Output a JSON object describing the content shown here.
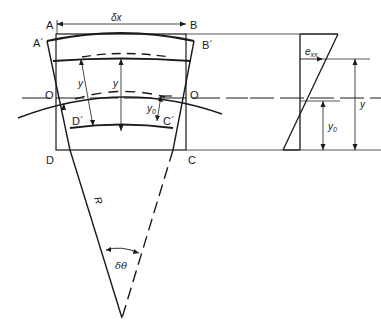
{
  "figure": {
    "colors": {
      "line": "#1a1a1a",
      "thin": "#444444",
      "background": "#ffffff"
    }
  },
  "left_diagram": {
    "labels": {
      "A": "A",
      "B": "B",
      "A_prime": "A´",
      "B_prime": "B´",
      "C": "C",
      "D": "D",
      "C_prime": "C´",
      "D_prime": "D´",
      "O_left": "O",
      "O_right": "O",
      "width": "δx",
      "y_left": "y",
      "y_center": "y",
      "y0": "y",
      "y0_sub": "0",
      "radius": "R",
      "angle": "δθ"
    }
  },
  "right_diagram": {
    "labels": {
      "strain": "e",
      "strain_sub": "xx",
      "y": "y",
      "y0": "y",
      "y0_sub": "0"
    }
  }
}
